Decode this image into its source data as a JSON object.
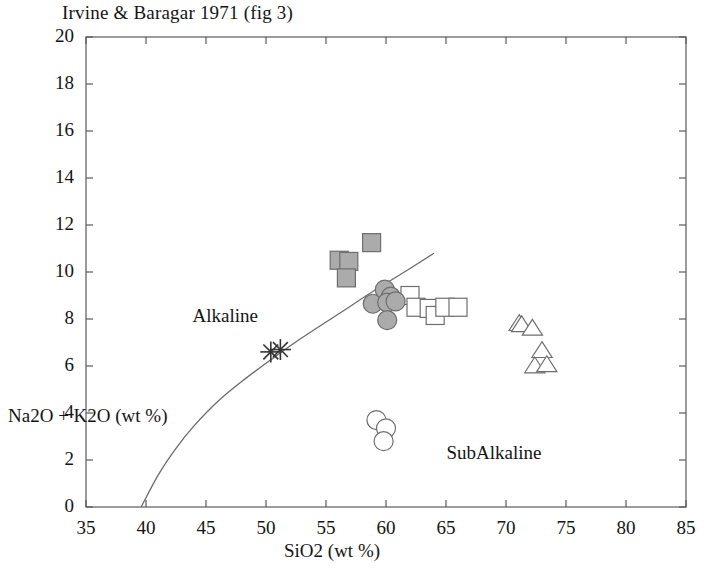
{
  "chart_data": {
    "type": "scatter",
    "title": "Irvine & Baragar 1971 (fig 3)",
    "xlabel": "SiO2  (wt %)",
    "ylabel": "Na2O + K2O  (wt %)",
    "xlim": [
      35,
      85
    ],
    "ylim": [
      0,
      20
    ],
    "xticks": [
      35,
      40,
      45,
      50,
      55,
      60,
      65,
      70,
      75,
      80,
      85
    ],
    "yticks": [
      0,
      2,
      4,
      6,
      8,
      10,
      12,
      14,
      16,
      18,
      20
    ],
    "grid": false,
    "legend": "none",
    "annotations": [
      {
        "text": "Alkaline",
        "x": 46.6,
        "y": 8.05
      },
      {
        "text": "SubAlkaline",
        "x": 69.0,
        "y": 2.2
      }
    ],
    "divider_curve": {
      "name": "Alkaline / SubAlkaline divide",
      "points": [
        [
          39.6,
          0.0
        ],
        [
          41.0,
          1.35
        ],
        [
          42.5,
          2.5
        ],
        [
          44.0,
          3.45
        ],
        [
          46.0,
          4.5
        ],
        [
          48.0,
          5.35
        ],
        [
          50.5,
          6.3
        ],
        [
          53.0,
          7.2
        ],
        [
          56.0,
          8.2
        ],
        [
          59.0,
          9.2
        ],
        [
          62.0,
          10.15
        ],
        [
          64.0,
          10.8
        ]
      ]
    },
    "series": [
      {
        "name": "filled-square",
        "marker": "square",
        "fill": "#ababab",
        "edge": "#6e6e6e",
        "points": [
          [
            56.1,
            10.5
          ],
          [
            56.9,
            10.45
          ],
          [
            56.7,
            9.75
          ],
          [
            58.8,
            11.25
          ]
        ]
      },
      {
        "name": "filled-circle",
        "marker": "circle",
        "fill": "#ababab",
        "edge": "#6e6e6e",
        "points": [
          [
            58.9,
            8.65
          ],
          [
            59.9,
            9.25
          ],
          [
            60.4,
            8.95
          ],
          [
            60.1,
            8.7
          ],
          [
            60.8,
            8.75
          ],
          [
            60.1,
            7.95
          ]
        ]
      },
      {
        "name": "open-square",
        "marker": "square",
        "fill": "#ffffff",
        "edge": "#6e6e6e",
        "points": [
          [
            62.0,
            9.0
          ],
          [
            62.5,
            8.5
          ],
          [
            63.6,
            8.45
          ],
          [
            64.1,
            8.15
          ],
          [
            64.9,
            8.5
          ],
          [
            66.0,
            8.5
          ]
        ]
      },
      {
        "name": "open-circle",
        "marker": "circle",
        "fill": "#ffffff",
        "edge": "#6e6e6e",
        "points": [
          [
            59.2,
            3.7
          ],
          [
            60.0,
            3.35
          ],
          [
            59.8,
            2.8
          ]
        ]
      },
      {
        "name": "open-triangle",
        "marker": "triangle",
        "fill": "#ffffff",
        "edge": "#6e6e6e",
        "points": [
          [
            71.1,
            7.8
          ],
          [
            71.3,
            7.75
          ],
          [
            72.2,
            7.6
          ],
          [
            73.0,
            6.65
          ],
          [
            72.4,
            6.0
          ],
          [
            73.4,
            6.05
          ]
        ]
      },
      {
        "name": "star",
        "marker": "asterisk",
        "fill": "#4a4a4a",
        "edge": "#333333",
        "points": [
          [
            50.4,
            6.6
          ],
          [
            51.2,
            6.7
          ]
        ]
      }
    ]
  }
}
